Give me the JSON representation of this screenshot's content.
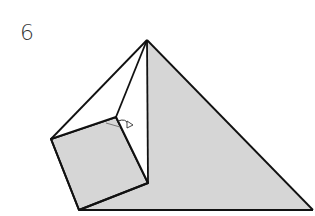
{
  "diagram": {
    "step_number": "6",
    "colors": {
      "paper_fill": "#d6d6d6",
      "stroke": "#111111",
      "background": "#ffffff"
    }
  }
}
